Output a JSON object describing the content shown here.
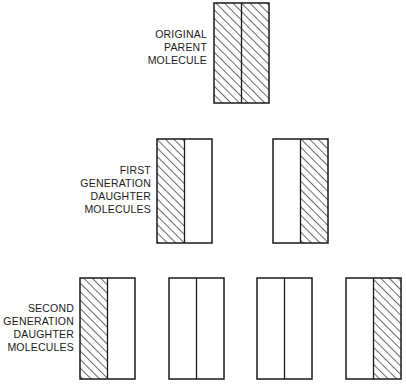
{
  "colors": {
    "stroke": "#1a1a1a",
    "background": "#ffffff"
  },
  "labels": {
    "parent": [
      "ORIGINAL",
      "PARENT",
      "MOLECULE"
    ],
    "first_generation": [
      "FIRST",
      "GENERATION",
      "DAUGHTER",
      "MOLECULES"
    ],
    "second_generation": [
      "SECOND",
      "GENERATION",
      "DAUGHTER",
      "MOLECULES"
    ]
  },
  "molecules": {
    "parent": [
      {
        "left_strand": "old",
        "right_strand": "old"
      }
    ],
    "first_generation": [
      {
        "left_strand": "old",
        "right_strand": "new"
      },
      {
        "left_strand": "new",
        "right_strand": "old"
      }
    ],
    "second_generation": [
      {
        "left_strand": "old",
        "right_strand": "new"
      },
      {
        "left_strand": "new",
        "right_strand": "new"
      },
      {
        "left_strand": "new",
        "right_strand": "new"
      },
      {
        "left_strand": "new",
        "right_strand": "old"
      }
    ]
  },
  "legend_semantics": {
    "old": "hatched (original parental strand)",
    "new": "white (newly synthesized strand)"
  }
}
